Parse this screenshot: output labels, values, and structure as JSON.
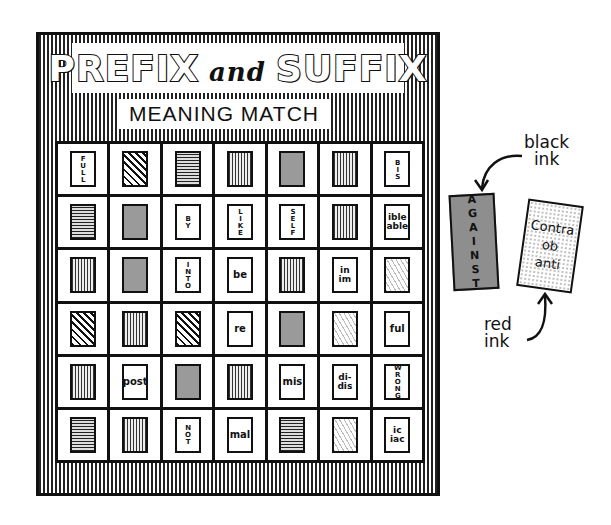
{
  "board": {
    "title_part1": "PREFIX",
    "title_and": "and",
    "title_part2": "SUFFIX",
    "subtitle": "MEANING MATCH",
    "rows": [
      [
        {
          "type": "text-v",
          "text": "FULL"
        },
        {
          "type": "pattern",
          "pattern": "chevron"
        },
        {
          "type": "pattern",
          "pattern": "hlines"
        },
        {
          "type": "pattern",
          "pattern": "vwave"
        },
        {
          "type": "pattern",
          "pattern": "gray"
        },
        {
          "type": "pattern",
          "pattern": "vwave"
        },
        {
          "type": "text-v",
          "text": "BIS"
        }
      ],
      [
        {
          "type": "pattern",
          "pattern": "hlines"
        },
        {
          "type": "pattern",
          "pattern": "gray"
        },
        {
          "type": "text-v",
          "text": "BY"
        },
        {
          "type": "text-v",
          "text": "LIKE"
        },
        {
          "type": "text-v",
          "text": "SELF"
        },
        {
          "type": "pattern",
          "pattern": "vwave"
        },
        {
          "type": "text-2",
          "text": "ible\nable"
        }
      ],
      [
        {
          "type": "pattern",
          "pattern": "vwave"
        },
        {
          "type": "pattern",
          "pattern": "gray"
        },
        {
          "type": "text-v",
          "text": "INTO"
        },
        {
          "type": "text-h",
          "text": "be"
        },
        {
          "type": "pattern",
          "pattern": "vwave"
        },
        {
          "type": "text-2",
          "text": "in\nim"
        },
        {
          "type": "pattern",
          "pattern": "speckle"
        }
      ],
      [
        {
          "type": "pattern",
          "pattern": "chevron"
        },
        {
          "type": "pattern",
          "pattern": "vwave"
        },
        {
          "type": "pattern",
          "pattern": "chevron"
        },
        {
          "type": "text-h",
          "text": "re"
        },
        {
          "type": "pattern",
          "pattern": "gray"
        },
        {
          "type": "pattern",
          "pattern": "speckle"
        },
        {
          "type": "text-h",
          "text": "ful"
        }
      ],
      [
        {
          "type": "pattern",
          "pattern": "vwave"
        },
        {
          "type": "text-h",
          "text": "post"
        },
        {
          "type": "pattern",
          "pattern": "gray"
        },
        {
          "type": "pattern",
          "pattern": "vwave"
        },
        {
          "type": "text-h",
          "text": "mis"
        },
        {
          "type": "text-2",
          "text": "di-\ndis"
        },
        {
          "type": "text-v",
          "text": "WRONG"
        }
      ],
      [
        {
          "type": "pattern",
          "pattern": "hlines"
        },
        {
          "type": "pattern",
          "pattern": "vwave"
        },
        {
          "type": "text-v",
          "text": "NOT"
        },
        {
          "type": "text-h",
          "text": "mal"
        },
        {
          "type": "pattern",
          "pattern": "hlines"
        },
        {
          "type": "pattern",
          "pattern": "speckle"
        },
        {
          "type": "text-2",
          "text": "ic\niac"
        }
      ]
    ]
  },
  "annotations": {
    "black_ink_label": "black\nink",
    "black_ink_card_text": "AGAINST",
    "red_ink_label": "red\nink",
    "red_ink_card_text": "Contra\nob\nanti"
  }
}
